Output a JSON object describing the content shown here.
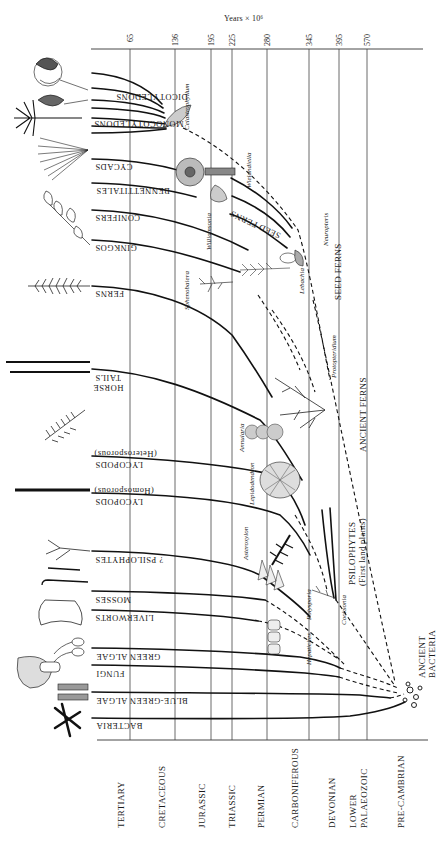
{
  "axis": {
    "title": "Years × 10⁶",
    "ticks": [
      "65",
      "136",
      "195",
      "225",
      "280",
      "345",
      "395",
      "570"
    ]
  },
  "periods": [
    "TERTIARY",
    "CRETACEOUS",
    "JURASSIC",
    "TRIASSIC",
    "PERMIAN",
    "CARBONIFEROUS",
    "DEVONIAN",
    "LOWER PALAEOZOIC",
    "PRE-CAMBRIAN"
  ],
  "periods_split": {
    "lower_palaeozoic_1": "LOWER",
    "lower_palaeozoic_2": "PALAEOZOIC"
  },
  "groups": {
    "dicotyledons": "DICOTYLEDONS",
    "monocotyledons": "MONOCOTYLEDONS",
    "cycads": "CYCADS",
    "bennettitales": "BENNETTITALES",
    "conifers": "CONIFERS",
    "ginkgos": "GINKGOS",
    "ferns": "FERNS",
    "horse_tails_1": "HORSE",
    "horse_tails_2": "TAILS",
    "lycopods_hetero": "LYCOPODS",
    "lycopods_hetero_note": "(Heterosporous)",
    "lycopods_homo": "LYCOPODS",
    "lycopods_homo_note": "(Homosporous)",
    "psilophytes_q": "? PSILOPHYTES",
    "mosses": "MOSSES",
    "liverworts": "LIVERWORTS",
    "green_algae": "GREEN  ALGAE",
    "fungi": "FUNGI",
    "blue_green_algae": "BLUE-GREEN  ALGAE",
    "bacteria": "BACTERIA",
    "seed_ferns_upper": "SEED FERNS"
  },
  "major_groups": {
    "seed_ferns": "SEED FERNS",
    "ancient_ferns": "ANCIENT FERNS",
    "psilophytes": "PSILOPHYTES",
    "psilophytes_note": "(First land plants)",
    "ancient_bacteria_1": "ANCIENT",
    "ancient_bacteria_2": "BACTERIA"
  },
  "genera": {
    "celastrophyllum": "Celastrophyllum",
    "wielandiella": "Wielandiella",
    "williamsonia": "Williamsonia",
    "neuropteris": "Neuropteris",
    "lebachia": "Lebachia",
    "sphenobaiera": "Sphenobaiera",
    "protopteridium": "Protopteridium",
    "annularia": "Annularia",
    "lepidodendron": "Lepidodendron",
    "asteroxylon": "Asteroxylon",
    "polysporia": "Polysporia",
    "hepaticites": "Hepaticites",
    "cooksonia": "Cooksonia"
  }
}
